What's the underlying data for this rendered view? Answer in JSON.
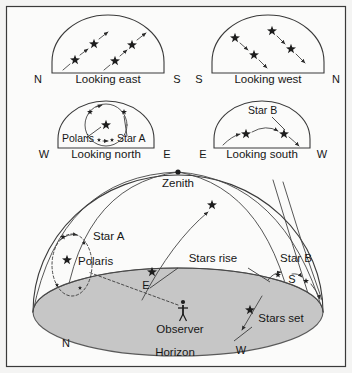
{
  "figure": {
    "background_color": "#f4f4f3",
    "panel_fill": "#fbfbfa",
    "ground_fill": "#c6c6c6",
    "ink_color": "#1d1d1d",
    "border_color": "#3a3a3a"
  },
  "panels": [
    {
      "id": "looking-east",
      "caption": "Looking east",
      "left_direction": "N",
      "right_direction": "S",
      "star_count": 4,
      "motion": "stars rise diagonally upward toward the right",
      "trail_direction": "up-right"
    },
    {
      "id": "looking-west",
      "caption": "Looking west",
      "left_direction": "S",
      "right_direction": "N",
      "star_count": 4,
      "motion": "stars set diagonally downward toward the right",
      "trail_direction": "down-right"
    },
    {
      "id": "looking-north",
      "caption": "Looking north",
      "left_direction": "W",
      "right_direction": "E",
      "star_count": 5,
      "motion": "stars circle counter-clockwise around Polaris",
      "labels": [
        "Polaris",
        "Star A"
      ]
    },
    {
      "id": "looking-south",
      "caption": "Looking south",
      "left_direction": "E",
      "right_direction": "W",
      "star_count": 2,
      "motion": "stars arc low across the southern sky from east to west",
      "labels": [
        "Star B"
      ]
    }
  ],
  "dome": {
    "zenith_label": "Zenith",
    "horizon_label": "Horizon",
    "observer_label": "Observer",
    "stars_rise_label": "Stars rise",
    "stars_set_label": "Stars set",
    "polaris_label": "Polaris",
    "star_a_label": "Star A",
    "star_b_label": "Star B",
    "compass": {
      "north": "N",
      "east": "E",
      "south": "S",
      "west": "W"
    }
  }
}
